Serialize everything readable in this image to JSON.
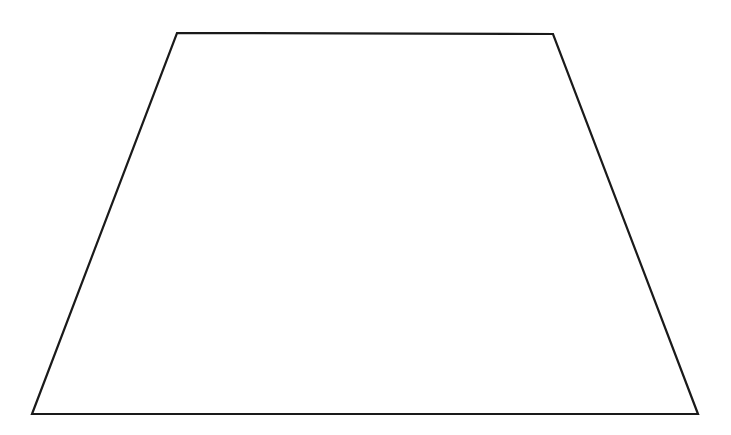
{
  "canvas": {
    "width": 731,
    "height": 435,
    "background_color": "#ffffff",
    "title": "Trapezoid Shape"
  },
  "figure": {
    "name": "trapezoid",
    "shape_type": "quadrilateral",
    "fill_color": "#ffffff",
    "stroke_color": "#1a1a1a",
    "stroke_width": 2.2,
    "closed": true,
    "vertices": [
      {
        "label": "top-left",
        "x": 177,
        "y": 33
      },
      {
        "label": "top-right",
        "x": 553,
        "y": 34
      },
      {
        "label": "bottom-right",
        "x": 698,
        "y": 414
      },
      {
        "label": "bottom-left",
        "x": 32,
        "y": 414
      }
    ],
    "points_attr": "177,33 553,34 698,414 32,414",
    "edges": [
      {
        "name": "top-edge",
        "from": "top-left",
        "to": "top-right"
      },
      {
        "name": "right-edge",
        "from": "top-right",
        "to": "bottom-right"
      },
      {
        "name": "bottom-edge",
        "from": "bottom-right",
        "to": "bottom-left"
      },
      {
        "name": "left-edge",
        "from": "bottom-left",
        "to": "top-left"
      }
    ]
  },
  "labels": {
    "has_text": false,
    "annotations": []
  }
}
